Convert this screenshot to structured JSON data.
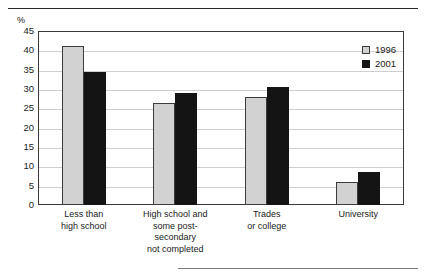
{
  "chart_data": {
    "type": "bar",
    "title": "",
    "xlabel": "",
    "ylabel": "%",
    "ylim": [
      0,
      45
    ],
    "ytick_step": 5,
    "yticks": [
      "45",
      "40",
      "35",
      "30",
      "25",
      "20",
      "15",
      "10",
      "5",
      "0"
    ],
    "grid": true,
    "legend_position": "top-right",
    "categories": [
      "Less than\nhigh school",
      "High school and\nsome post-\nsecondary\nnot completed",
      "Trades\nor college",
      "University"
    ],
    "series": [
      {
        "name": "1996",
        "color": "#d2d2d2",
        "values": [
          41,
          26.5,
          28,
          6
        ]
      },
      {
        "name": "2001",
        "color": "#141414",
        "values": [
          34.5,
          29,
          30.5,
          8.5
        ]
      }
    ]
  },
  "legend": {
    "items": [
      {
        "label": "1996",
        "swatch": "s1996"
      },
      {
        "label": "2001",
        "swatch": "s2001"
      }
    ]
  }
}
